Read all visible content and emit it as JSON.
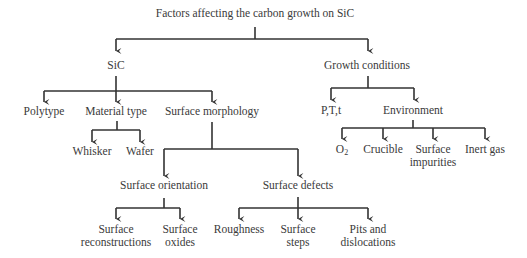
{
  "diagram": {
    "root": "Factors affecting the carbon growth on SiC",
    "sic": {
      "label": "SiC",
      "polytype": "Polytype",
      "material_type": {
        "label": "Material type",
        "children": [
          "Whisker",
          "Wafer"
        ]
      },
      "surface_morphology": {
        "label": "Surface morphology",
        "surface_orientation": {
          "label": "Surface orientation",
          "children": [
            {
              "line1": "Surface",
              "line2": "reconstructions"
            },
            {
              "line1": "Surface",
              "line2": "oxides"
            }
          ]
        },
        "surface_defects": {
          "label": "Surface defects",
          "children": [
            {
              "line1": "Roughness",
              "line2": ""
            },
            {
              "line1": "Surface",
              "line2": "steps"
            },
            {
              "line1": "Pits and",
              "line2": "dislocations"
            }
          ]
        }
      }
    },
    "growth_conditions": {
      "label": "Growth conditions",
      "ptt": "P,T,t",
      "environment": {
        "label": "Environment",
        "o2_base": "O",
        "o2_sub": "2",
        "crucible": "Crucible",
        "surface_impurities": {
          "line1": "Surface",
          "line2": "impurities"
        },
        "inert_gas": "Inert gas"
      }
    },
    "colors": {
      "line": "#333333",
      "text": "#3a3a3a",
      "background": "#ffffff"
    }
  }
}
